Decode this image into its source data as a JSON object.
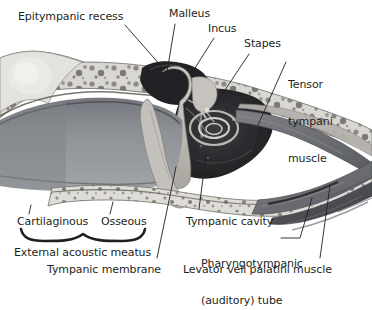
{
  "figure": {
    "style": "grayscale watercolor / wash anatomical illustration",
    "width": 372,
    "height": 291,
    "background": "#ffffff",
    "ink_color": "#231f20"
  },
  "labels": {
    "epitympanic_recess": "Epitympanic recess",
    "malleus": "Malleus",
    "incus": "Incus",
    "stapes": "Stapes",
    "tensor_tympani": "Tensor\ntympani\nmuscle",
    "tensor_tympani_lines": [
      "Tensor",
      "tympani",
      "muscle"
    ],
    "cartilaginous": "Cartilaginous",
    "osseous": "Osseous",
    "external_acoustic_meatus": "External acoustic meatus",
    "tympanic_membrane": "Tympanic membrane",
    "tympanic_cavity": "Tympanic cavity",
    "pharyngotympanic_tube": "Pharyngotympanic\n(auditory) tube",
    "pharyngotympanic_tube_lines": [
      "Pharyngotympanic",
      "(auditory) tube"
    ],
    "levator_veli_palatini": "Levator veli palatini muscle"
  },
  "label_positions": {
    "epitympanic_recess": {
      "x": 18,
      "y": 11
    },
    "malleus": {
      "x": 169,
      "y": 8
    },
    "incus": {
      "x": 208,
      "y": 23
    },
    "stapes": {
      "x": 244,
      "y": 38
    },
    "tensor_tympani": {
      "x": 288,
      "y": 55
    },
    "cartilaginous": {
      "x": 17,
      "y": 216
    },
    "osseous": {
      "x": 101,
      "y": 216
    },
    "external_acoustic_meatus": {
      "x": 14,
      "y": 247
    },
    "tympanic_membrane": {
      "x": 47,
      "y": 264
    },
    "tympanic_cavity": {
      "x": 186,
      "y": 216
    },
    "pharyngotympanic_tube": {
      "x": 201,
      "y": 234
    },
    "levator_veli_palatini": {
      "x": 183,
      "y": 264
    }
  },
  "leader_lines": [
    {
      "name": "epitympanic-recess-leader",
      "x1": 125,
      "y1": 25,
      "x2": 161,
      "y2": 66
    },
    {
      "name": "malleus-leader",
      "x1": 175,
      "y1": 24,
      "x2": 166,
      "y2": 78
    },
    {
      "name": "incus-leader",
      "x1": 214,
      "y1": 38,
      "x2": 190,
      "y2": 76
    },
    {
      "name": "stapes-leader",
      "x1": 249,
      "y1": 54,
      "x2": 215,
      "y2": 105
    },
    {
      "name": "tensor-tympani-leader",
      "x1": 286,
      "y1": 62,
      "x2": 258,
      "y2": 125
    },
    {
      "name": "cartilaginous-tick",
      "x1": 31,
      "y1": 205,
      "x2": 29,
      "y2": 214
    },
    {
      "name": "osseous-tick",
      "x1": 113,
      "y1": 202,
      "x2": 110,
      "y2": 214
    },
    {
      "name": "tympanic-membrane-leader",
      "x1": 176,
      "y1": 167,
      "x2": 157,
      "y2": 258
    },
    {
      "name": "tympanic-cavity-leader",
      "x1": 206,
      "y1": 155,
      "x2": 199,
      "y2": 209
    },
    {
      "name": "pharyngotympanic-leader",
      "x1": 310,
      "y1": 200,
      "x2": 296,
      "y2": 244
    },
    {
      "name": "levator-veli-leader",
      "x1": 330,
      "y1": 186,
      "x2": 320,
      "y2": 258
    }
  ],
  "brace": {
    "name": "external-acoustic-meatus-brace",
    "left": 20,
    "right": 146,
    "y": 234,
    "peak_x": 83
  },
  "structures": [
    {
      "name": "mastoid-air-cells",
      "tone": "#d8d6d2"
    },
    {
      "name": "temporal-bone-cancellous",
      "tone": "#cfcdc8"
    },
    {
      "name": "external-acoustic-meatus-canal",
      "tone": "#8e9095"
    },
    {
      "name": "tympanic-cavity-void",
      "tone": "#2a2a2c"
    },
    {
      "name": "auditory-ossicles",
      "tone": "#b9b6b0"
    },
    {
      "name": "pharyngotympanic-tube",
      "tone": "#6f7176"
    },
    {
      "name": "levator-veli-palatini-muscle",
      "tone": "#55575c"
    }
  ]
}
